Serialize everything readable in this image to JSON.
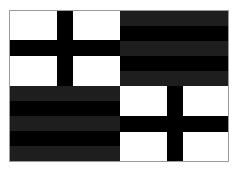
{
  "figure": {
    "colors": {
      "white": "#ffffff",
      "black": "#000000",
      "dark_grey": "#1e1e1e",
      "border": "#9a9a9a"
    },
    "quadrants": [
      {
        "position": "top-left",
        "pattern": "cross",
        "background": "#ffffff",
        "bar_color": "#000000"
      },
      {
        "position": "top-right",
        "pattern": "horizontal-stripes",
        "stripes": [
          "#1e1e1e",
          "#000000",
          "#1e1e1e",
          "#000000",
          "#1e1e1e"
        ]
      },
      {
        "position": "bottom-left",
        "pattern": "horizontal-stripes",
        "stripes": [
          "#1e1e1e",
          "#000000",
          "#1e1e1e",
          "#000000",
          "#1e1e1e"
        ]
      },
      {
        "position": "bottom-right",
        "pattern": "cross",
        "background": "#ffffff",
        "bar_color": "#000000"
      }
    ]
  }
}
